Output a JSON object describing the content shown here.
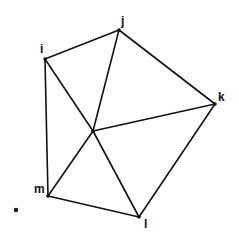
{
  "diagram": {
    "type": "graph",
    "colors": {
      "background": "#ffffff",
      "stroke": "#111111"
    },
    "vertices": [
      {
        "id": "i",
        "label": "i",
        "x": 45,
        "y": 59,
        "label_x": 40,
        "label_y": 53
      },
      {
        "id": "j",
        "label": "j",
        "x": 119,
        "y": 30,
        "label_x": 121,
        "label_y": 25
      },
      {
        "id": "k",
        "label": "k",
        "x": 215,
        "y": 104,
        "label_x": 218,
        "label_y": 101
      },
      {
        "id": "l",
        "label": "l",
        "x": 139,
        "y": 217,
        "label_x": 144,
        "label_y": 228
      },
      {
        "id": "m",
        "label": "m",
        "x": 48,
        "y": 196,
        "label_x": 34,
        "label_y": 193
      },
      {
        "id": "center",
        "label": "",
        "x": 93,
        "y": 131,
        "label_x": 0,
        "label_y": 0
      }
    ],
    "edges": [
      [
        "i",
        "j"
      ],
      [
        "j",
        "k"
      ],
      [
        "k",
        "l"
      ],
      [
        "l",
        "m"
      ],
      [
        "m",
        "i"
      ],
      [
        "center",
        "i"
      ],
      [
        "center",
        "j"
      ],
      [
        "center",
        "k"
      ],
      [
        "center",
        "l"
      ],
      [
        "center",
        "m"
      ]
    ],
    "isolated_points": [
      {
        "x": 16,
        "y": 210
      }
    ]
  },
  "labels": {
    "i": "i",
    "j": "j",
    "k": "k",
    "l": "l",
    "m": "m"
  }
}
